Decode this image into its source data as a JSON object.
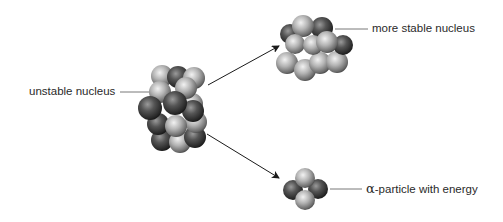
{
  "labels": {
    "unstable": "unstable nucleus",
    "stable": "more stable nucleus",
    "alpha_symbol": "α",
    "alpha_rest": "-particle with energy"
  },
  "colors": {
    "background": "#ffffff",
    "text": "#2a2a2a",
    "arrow": "#1a1a1a",
    "leader_line": "#555555",
    "nucleon_light": "#b8b8b8",
    "nucleon_dark": "#3a3a3a"
  },
  "nuclei": {
    "unstable": {
      "center": [
        175,
        110
      ],
      "nucleons": 20
    },
    "stable": {
      "center": [
        315,
        47
      ],
      "nucleons": 16
    },
    "alpha": {
      "center": [
        305,
        188
      ],
      "nucleons": 4
    }
  },
  "arrows": [
    {
      "name": "to-stable",
      "from": [
        208,
        85
      ],
      "to": [
        280,
        45
      ]
    },
    {
      "name": "to-alpha",
      "from": [
        207,
        134
      ],
      "to": [
        280,
        179
      ]
    }
  ]
}
